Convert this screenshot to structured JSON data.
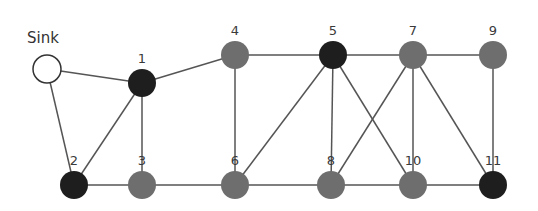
{
  "diagram": {
    "type": "network-graph",
    "colors": {
      "black_node": "#1e1e1e",
      "gray_node": "#6e6e6e",
      "sink_fill": "#ffffff",
      "sink_stroke": "#333333",
      "edge": "#555555"
    },
    "nodes": [
      {
        "id": "sink",
        "label": "Sink",
        "x": 47,
        "y": 69,
        "kind": "sink"
      },
      {
        "id": "1",
        "label": "1",
        "x": 142,
        "y": 83,
        "kind": "black"
      },
      {
        "id": "2",
        "label": "2",
        "x": 74,
        "y": 185,
        "kind": "black"
      },
      {
        "id": "3",
        "label": "3",
        "x": 142,
        "y": 185,
        "kind": "gray"
      },
      {
        "id": "4",
        "label": "4",
        "x": 235,
        "y": 55,
        "kind": "gray"
      },
      {
        "id": "5",
        "label": "5",
        "x": 333,
        "y": 55,
        "kind": "black"
      },
      {
        "id": "6",
        "label": "6",
        "x": 235,
        "y": 185,
        "kind": "gray"
      },
      {
        "id": "7",
        "label": "7",
        "x": 413,
        "y": 55,
        "kind": "gray"
      },
      {
        "id": "8",
        "label": "8",
        "x": 331,
        "y": 185,
        "kind": "gray"
      },
      {
        "id": "9",
        "label": "9",
        "x": 493,
        "y": 55,
        "kind": "gray"
      },
      {
        "id": "10",
        "label": "10",
        "x": 413,
        "y": 185,
        "kind": "gray"
      },
      {
        "id": "11",
        "label": "11",
        "x": 493,
        "y": 185,
        "kind": "black"
      }
    ],
    "edges": [
      [
        "sink",
        "1"
      ],
      [
        "sink",
        "2"
      ],
      [
        "1",
        "2"
      ],
      [
        "1",
        "3"
      ],
      [
        "1",
        "4"
      ],
      [
        "2",
        "3"
      ],
      [
        "3",
        "6"
      ],
      [
        "4",
        "5"
      ],
      [
        "4",
        "6"
      ],
      [
        "5",
        "6"
      ],
      [
        "5",
        "8"
      ],
      [
        "5",
        "10"
      ],
      [
        "5",
        "7"
      ],
      [
        "6",
        "8"
      ],
      [
        "7",
        "8"
      ],
      [
        "7",
        "10"
      ],
      [
        "7",
        "11"
      ],
      [
        "7",
        "9"
      ],
      [
        "8",
        "10"
      ],
      [
        "9",
        "11"
      ],
      [
        "10",
        "11"
      ]
    ]
  }
}
